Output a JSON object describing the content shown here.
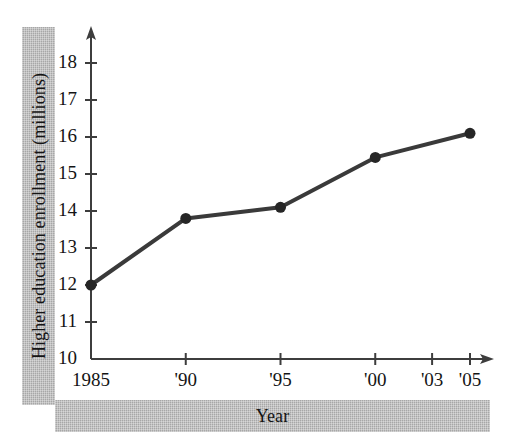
{
  "figure": {
    "background_color": "#ffffff",
    "band_color": "#b0b0b0",
    "ink_color": "#3a3a3a",
    "text_color": "#141414"
  },
  "labels": {
    "y_axis_band": "Higher education enrollment (millions)",
    "x_axis_band": "Year"
  },
  "chart_data": {
    "type": "line",
    "title": "",
    "subtitle": "",
    "xlabel": "Year",
    "ylabel": "Higher education enrollment (millions)",
    "x": [
      1985,
      1990,
      1995,
      2000,
      2005
    ],
    "values": [
      12.0,
      13.8,
      14.1,
      15.45,
      16.1
    ],
    "categories": [
      "1985",
      "'90",
      "'95",
      "'00",
      "'05"
    ],
    "x_tick_labels": [
      "1985",
      "'90",
      "'95",
      "'00",
      "'03",
      "'05"
    ],
    "x_tick_values": [
      1985,
      1990,
      1995,
      2000,
      2003,
      2005
    ],
    "y_tick_labels": [
      "10",
      "11",
      "12",
      "13",
      "14",
      "15",
      "16",
      "17",
      "18"
    ],
    "y_tick_values": [
      10,
      11,
      12,
      13,
      14,
      15,
      16,
      17,
      18
    ],
    "xlim": [
      1985,
      2006.5
    ],
    "ylim": [
      10,
      18.8
    ],
    "grid": false,
    "legend": null,
    "marker": "filled-circle",
    "line_color": "#3a3a3a",
    "axis_arrows": [
      "x-right",
      "y-up"
    ]
  }
}
